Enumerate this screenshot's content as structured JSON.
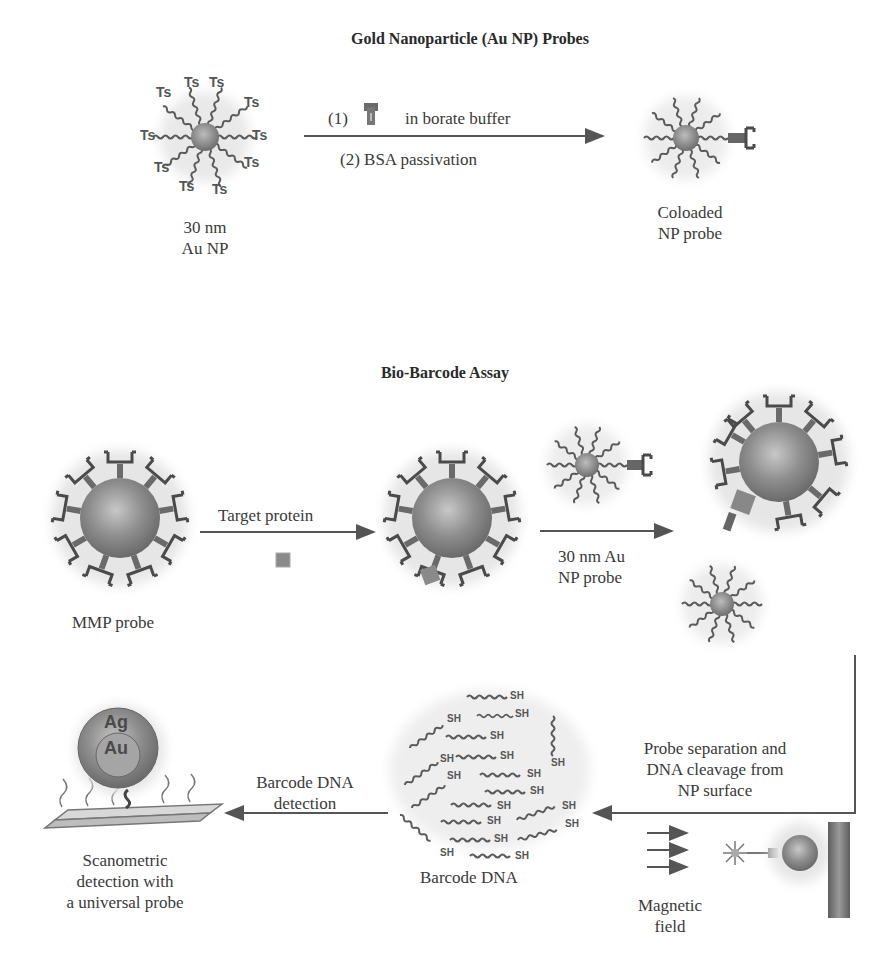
{
  "figure": {
    "top_panel": {
      "title": "Gold Nanoparticle (Au NP) Probes",
      "start_particle": {
        "label_line1": "30 nm",
        "label_line2": "Au NP",
        "ligand_label": "Ts"
      },
      "step1_prefix": "(1)",
      "step1_suffix": "in borate buffer",
      "step2": "(2) BSA passivation",
      "end_particle": {
        "label_line1": "Coloaded",
        "label_line2": "NP probe"
      }
    },
    "bottom_panel": {
      "title": "Bio-Barcode Assay",
      "mmp_probe_label": "MMP probe",
      "target_protein_label": "Target protein",
      "au_np_probe_line1": "30 nm Au",
      "au_np_probe_line2": "NP probe",
      "probe_separation_line1": "Probe separation and",
      "probe_separation_line2": "DNA cleavage from",
      "probe_separation_line3": "NP surface",
      "magnetic_field_line1": "Magnetic",
      "magnetic_field_line2": "field",
      "barcode_dna_label": "Barcode DNA",
      "barcode_thiol_label": "SH",
      "barcode_detection_line1": "Barcode DNA",
      "barcode_detection_line2": "detection",
      "scanometric_line1": "Scanometric",
      "scanometric_line2": "detection with",
      "scanometric_line3": "a universal probe",
      "silver_label": "Ag",
      "gold_label": "Au"
    },
    "colors": {
      "particle": "#8a8a8a",
      "ligand": "#5a5a5a",
      "arrow": "#555555",
      "text": "#3a3a3a"
    }
  }
}
